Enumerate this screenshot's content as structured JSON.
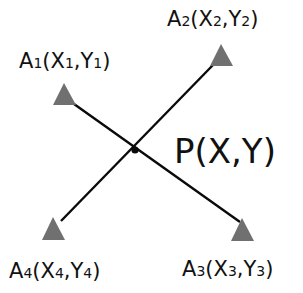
{
  "diagram": {
    "title": "",
    "colors": {
      "background": "#ffffff",
      "line": "#0a0a0a",
      "marker": "#707070",
      "text": "#111111"
    },
    "center": {
      "name": "P",
      "label_main": "P(X,Y)",
      "x": 135,
      "y": 150
    },
    "points": [
      {
        "id": "A1",
        "letter": "A",
        "sub": "1",
        "xname": "X",
        "yname": "Y",
        "x": 64,
        "y": 96
      },
      {
        "id": "A2",
        "letter": "A",
        "sub": "2",
        "xname": "X",
        "yname": "Y",
        "x": 221,
        "y": 57
      },
      {
        "id": "A3",
        "letter": "A",
        "sub": "3",
        "xname": "X",
        "yname": "Y",
        "x": 242,
        "y": 231
      },
      {
        "id": "A4",
        "letter": "A",
        "sub": "4",
        "xname": "X",
        "yname": "Y",
        "x": 53,
        "y": 230
      }
    ],
    "lines": [
      {
        "from": "A1",
        "to": "A3"
      },
      {
        "from": "A2",
        "to": "A4"
      }
    ],
    "labels": {
      "a1": {
        "A": "A",
        "s1": "1",
        "open": "(X",
        "s2": "1",
        "mid": ",Y",
        "s3": "1",
        "close": ")"
      },
      "a2": {
        "A": "A",
        "s1": "2",
        "open": "(X",
        "s2": "2",
        "mid": ",Y",
        "s3": "2",
        "close": ")"
      },
      "a3": {
        "A": "A",
        "s1": "3",
        "open": "(X",
        "s2": "3",
        "mid": ",Y",
        "s3": "3",
        "close": ")"
      },
      "a4": {
        "A": "A",
        "s1": "4",
        "open": "(X",
        "s2": "4",
        "mid": ",Y",
        "s3": "4",
        "close": ")"
      },
      "p": "P(X,Y)"
    }
  }
}
